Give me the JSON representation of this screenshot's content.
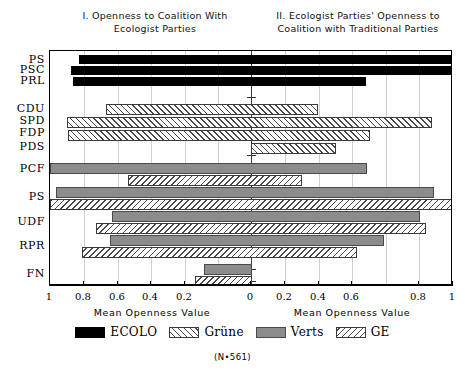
{
  "titles": {
    "left": "I. Openness to Coalition With Ecologist Parties",
    "right": "II. Ecologist Parties' Openness to Coalition with Traditional Parties"
  },
  "axis": {
    "left_caption": "Mean Openness Value",
    "right_caption": "Mean Openness Value",
    "tick_labels": [
      "1",
      "0.8",
      "0.6",
      "0.4",
      "0.2",
      "0",
      "0.2",
      "0.4",
      "0.6",
      "0.8",
      "1"
    ]
  },
  "legend": {
    "items": [
      {
        "label": "ECOLO",
        "pattern": "ecolo"
      },
      {
        "label": "Grüne",
        "pattern": "grune"
      },
      {
        "label": "Verts",
        "pattern": "verts"
      },
      {
        "label": "GE",
        "pattern": "ge"
      }
    ]
  },
  "footnote": "(N•561)",
  "categories": [
    "PS",
    "PSC",
    "PRL",
    "CDU",
    "SPD",
    "FDP",
    "PDS",
    "PCF",
    "PS",
    "UDF",
    "RPR",
    "FN"
  ],
  "chart_data": {
    "type": "bar",
    "orientation": "horizontal",
    "style": "diverging-bidirectional",
    "panels": [
      {
        "id": "I",
        "title": "I. Openness to Coalition With Ecologist Parties",
        "xlabel": "Mean Openness Value",
        "direction": "left",
        "xlim": [
          0,
          1
        ],
        "ticks": [
          1,
          0.8,
          0.6,
          0.4,
          0.2,
          0
        ]
      },
      {
        "id": "II",
        "title": "II. Ecologist Parties' Openness to Coalition with Traditional Parties",
        "xlabel": "Mean Openness Value",
        "direction": "right",
        "xlim": [
          0,
          1
        ],
        "ticks": [
          0,
          0.2,
          0.4,
          0.6,
          0.8,
          1
        ]
      }
    ],
    "grid": true,
    "legend_position": "bottom",
    "legend": [
      "ECOLO",
      "Grüne",
      "Verts",
      "GE"
    ],
    "note": "N•561",
    "series": [
      {
        "name": "ECOLO",
        "country": "Belgium",
        "pattern": "solid-black"
      },
      {
        "name": "Grüne",
        "country": "Germany",
        "pattern": "forward-hatch"
      },
      {
        "name": "Verts",
        "country": "France",
        "pattern": "solid-gray"
      },
      {
        "name": "GE",
        "country": "France",
        "pattern": "back-hatch"
      }
    ],
    "rows": [
      {
        "category": "PS",
        "series": "ECOLO",
        "left": 0.86,
        "right": 1.0
      },
      {
        "category": "PSC",
        "series": "ECOLO",
        "left": 0.9,
        "right": 1.0
      },
      {
        "category": "PRL",
        "series": "ECOLO",
        "left": 0.89,
        "right": 0.57
      },
      {
        "category": "CDU",
        "series": "Grüne",
        "left": 0.72,
        "right": 0.33
      },
      {
        "category": "SPD",
        "series": "Grüne",
        "left": 0.91,
        "right": 0.9
      },
      {
        "category": "FDP",
        "series": "Grüne",
        "left": 0.91,
        "right": 0.59
      },
      {
        "category": "PDS",
        "series": "Grüne",
        "left": 0.0,
        "right": 0.42
      },
      {
        "category": "PCF",
        "series": "Verts",
        "left": 1.0,
        "right": 0.58
      },
      {
        "category": "PCF",
        "series": "GE",
        "left": 0.61,
        "right": 0.25
      },
      {
        "category": "PS",
        "series": "Verts",
        "left": 0.97,
        "right": 0.91
      },
      {
        "category": "PS",
        "series": "GE",
        "left": 1.0,
        "right": 1.0
      },
      {
        "category": "UDF",
        "series": "Verts",
        "left": 0.69,
        "right": 0.84
      },
      {
        "category": "UDF",
        "series": "GE",
        "left": 0.77,
        "right": 0.87
      },
      {
        "category": "RPR",
        "series": "Verts",
        "left": 0.7,
        "right": 0.66
      },
      {
        "category": "RPR",
        "series": "GE",
        "left": 0.84,
        "right": 0.52
      },
      {
        "category": "FN",
        "series": "Verts",
        "left": 0.23,
        "right": 0.0
      },
      {
        "category": "FN",
        "series": "GE",
        "left": 0.28,
        "right": 0.0
      }
    ]
  },
  "layout": {
    "bars": [
      {
        "name": "bar-ps-ecolo",
        "cls": "ecolo",
        "x": 78,
        "w": 374,
        "y": 4,
        "h": 9
      },
      {
        "name": "bar-psc-ecolo",
        "cls": "ecolo",
        "x": 70,
        "w": 382,
        "y": 15,
        "h": 9
      },
      {
        "name": "bar-prl-ecolo",
        "cls": "ecolo",
        "x": 72,
        "w": 293,
        "y": 26,
        "h": 9
      },
      {
        "name": "bar-cdu-grune",
        "cls": "grune",
        "x": 105,
        "w": 212,
        "y": 53,
        "h": 11
      },
      {
        "name": "bar-spd-grune",
        "cls": "grune",
        "x": 66,
        "w": 365,
        "y": 66,
        "h": 11
      },
      {
        "name": "bar-fdp-grune",
        "cls": "grune",
        "x": 67,
        "w": 302,
        "y": 79,
        "h": 11
      },
      {
        "name": "bar-pds-grune",
        "cls": "grune",
        "x": 250,
        "w": 85,
        "y": 92,
        "h": 11
      },
      {
        "name": "bar-pcf-verts",
        "cls": "verts",
        "x": 49,
        "w": 317,
        "y": 112,
        "h": 11
      },
      {
        "name": "bar-pcf-ge",
        "cls": "ge",
        "x": 127,
        "w": 174,
        "y": 124,
        "h": 11
      },
      {
        "name": "bar-ps2-verts",
        "cls": "verts",
        "x": 55,
        "w": 378,
        "y": 136,
        "h": 11
      },
      {
        "name": "bar-ps2-ge",
        "cls": "ge",
        "x": 49,
        "w": 403,
        "y": 148,
        "h": 11
      },
      {
        "name": "bar-udf-verts",
        "cls": "verts",
        "x": 111,
        "w": 308,
        "y": 160,
        "h": 11
      },
      {
        "name": "bar-udf-ge",
        "cls": "ge",
        "x": 95,
        "w": 330,
        "y": 172,
        "h": 11
      },
      {
        "name": "bar-rpr-verts",
        "cls": "verts",
        "x": 109,
        "w": 274,
        "y": 184,
        "h": 11
      },
      {
        "name": "bar-rpr-ge",
        "cls": "ge",
        "x": 81,
        "w": 275,
        "y": 196,
        "h": 11
      },
      {
        "name": "bar-fn-verts",
        "cls": "verts",
        "x": 203,
        "w": 48,
        "y": 213,
        "h": 11
      },
      {
        "name": "bar-fn-ge",
        "cls": "ge",
        "x": 194,
        "w": 57,
        "y": 225,
        "h": 11
      }
    ],
    "gridlines": [
      83,
      117,
      150,
      184,
      217,
      284,
      318,
      351,
      385,
      418
    ],
    "center_x": 250,
    "center_ticks": [
      46,
      60,
      104,
      116,
      142,
      155,
      168,
      180,
      193,
      205,
      218,
      230
    ],
    "cat_label_y": [
      3,
      13,
      24,
      52,
      64,
      76,
      90,
      112,
      140,
      165,
      189,
      217
    ],
    "axis_ticks": [
      {
        "x": 49,
        "label": "1"
      },
      {
        "x": 83,
        "label": "0.8"
      },
      {
        "x": 117,
        "label": "0.6"
      },
      {
        "x": 150,
        "label": "0.4"
      },
      {
        "x": 184,
        "label": "0.2"
      },
      {
        "x": 250,
        "label": "0"
      },
      {
        "x": 284,
        "label": "0.2"
      },
      {
        "x": 318,
        "label": "0.4"
      },
      {
        "x": 351,
        "label": "0.6"
      },
      {
        "x": 418,
        "label": "0.8"
      },
      {
        "x": 452,
        "label": "1"
      }
    ],
    "caption_left_x": 152,
    "caption_right_x": 352
  }
}
